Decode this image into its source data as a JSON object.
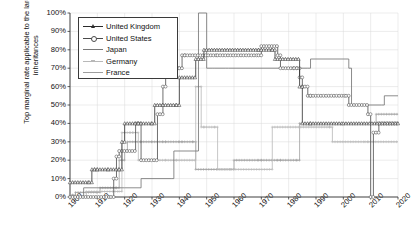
{
  "chart_data": {
    "type": "line",
    "title": "",
    "xlabel": "",
    "ylabel": "Top marginal rate applicable to the largest inheritances",
    "xlim": [
      1900,
      2020
    ],
    "ylim": [
      0,
      100
    ],
    "grid": true,
    "legend_position": "top-left",
    "y_tick_labels": [
      "100%",
      "90%",
      "80%",
      "70%",
      "60%",
      "50%",
      "40%",
      "30%",
      "20%",
      "10%",
      "0%"
    ],
    "y_tick_values": [
      100,
      90,
      80,
      70,
      60,
      50,
      40,
      30,
      20,
      10,
      0
    ],
    "x_tick_labels": [
      "1900",
      "1910",
      "1920",
      "1930",
      "1940",
      "1950",
      "1960",
      "1970",
      "1980",
      "1990",
      "2000",
      "2010",
      "2020"
    ],
    "x_tick_values": [
      1900,
      1910,
      1920,
      1930,
      1940,
      1950,
      1960,
      1970,
      1980,
      1990,
      2000,
      2010,
      2020
    ],
    "series": [
      {
        "name": "United Kingdom",
        "color": "#2b2b2b",
        "marker": "triangle",
        "x": [
          1900,
          1907,
          1908,
          1909,
          1910,
          1914,
          1918,
          1919,
          1920,
          1925,
          1930,
          1931,
          1934,
          1939,
          1940,
          1946,
          1949,
          1968,
          1969,
          1974,
          1975,
          1984,
          1985,
          1988,
          2000,
          2020
        ],
        "y": [
          8,
          8,
          15,
          15,
          15,
          15,
          15,
          30,
          40,
          40,
          40,
          50,
          50,
          50,
          65,
          75,
          80,
          80,
          80,
          80,
          75,
          60,
          40,
          40,
          40,
          40
        ]
      },
      {
        "name": "United States",
        "color": "#4a4a4a",
        "marker": "circle",
        "x": [
          1900,
          1915,
          1916,
          1917,
          1918,
          1924,
          1926,
          1932,
          1934,
          1935,
          1936,
          1940,
          1941,
          1942,
          1954,
          1969,
          1970,
          1976,
          1977,
          1982,
          1983,
          1984,
          1985,
          1987,
          1988,
          2001,
          2002,
          2009,
          2010,
          2011,
          2013,
          2020
        ],
        "y": [
          0,
          0,
          10,
          22,
          25,
          40,
          20,
          45,
          60,
          70,
          70,
          70,
          77,
          77,
          77,
          77,
          82,
          77,
          70,
          70,
          70,
          65,
          60,
          55,
          55,
          55,
          50,
          45,
          0,
          35,
          40,
          40
        ]
      },
      {
        "name": "Japan",
        "color": "#777777",
        "marker": "none",
        "x": [
          1900,
          1904,
          1905,
          1920,
          1926,
          1937,
          1938,
          1946,
          1947,
          1949,
          1950,
          1952,
          1953,
          1957,
          1958,
          1987,
          1988,
          2002,
          2003,
          2014,
          2015,
          2020
        ],
        "y": [
          0,
          0,
          5,
          5,
          10,
          10,
          25,
          25,
          100,
          100,
          70,
          70,
          70,
          70,
          70,
          70,
          75,
          70,
          50,
          50,
          55,
          55
        ]
      },
      {
        "name": "Germany",
        "color": "#b8b8b8",
        "marker": "plus",
        "x": [
          1900,
          1905,
          1906,
          1918,
          1919,
          1920,
          1922,
          1923,
          1925,
          1930,
          1931,
          1935,
          1939,
          1946,
          1947,
          1948,
          1949,
          1953,
          1954,
          1973,
          1974,
          1995,
          1996,
          2008,
          2009,
          2020
        ],
        "y": [
          0,
          0,
          3,
          3,
          35,
          35,
          35,
          35,
          20,
          20,
          20,
          20,
          20,
          60,
          60,
          38,
          38,
          38,
          15,
          15,
          38,
          38,
          30,
          30,
          30,
          30
        ]
      },
      {
        "name": "France",
        "color": "#9e9e9e",
        "marker": "plus",
        "x": [
          1900,
          1901,
          1902,
          1910,
          1911,
          1917,
          1918,
          1920,
          1921,
          1926,
          1930,
          1934,
          1935,
          1940,
          1941,
          1945,
          1946,
          1959,
          1960,
          1969,
          1970,
          1976,
          1977,
          1983,
          1984,
          2011,
          2012,
          2020
        ],
        "y": [
          1,
          1,
          2.5,
          2.5,
          5,
          5,
          20,
          25,
          30,
          30,
          30,
          30,
          30,
          30,
          30,
          30,
          15,
          15,
          20,
          20,
          20,
          20,
          20,
          20,
          40,
          40,
          45,
          45
        ]
      }
    ]
  },
  "legend": {
    "items": [
      {
        "label": "United Kingdom"
      },
      {
        "label": "United States"
      },
      {
        "label": "Japan"
      },
      {
        "label": "Germany"
      },
      {
        "label": "France"
      }
    ]
  }
}
